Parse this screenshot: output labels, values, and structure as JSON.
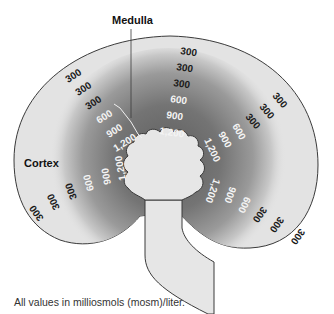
{
  "labels": {
    "medulla": "Medulla",
    "cortex": "Cortex"
  },
  "caption": "All values in milliosmols (mosm)/liter.",
  "colors": {
    "cortex_fill": "#e3e3e3",
    "medulla_dark": "#6b6b6b",
    "outline": "#3a3a3a",
    "pelvis_fill": "#e6e6e6",
    "cortex_text": "#1a1a1a",
    "medulla_text": "#f4f4f4"
  },
  "columns": [
    {
      "name": "upper-left",
      "values": [
        "300",
        "300",
        "300",
        "600",
        "900",
        "1,200"
      ]
    },
    {
      "name": "top",
      "values": [
        "300",
        "300",
        "300",
        "600",
        "900",
        "1,200"
      ]
    },
    {
      "name": "upper-right",
      "values": [
        "300",
        "300",
        "300",
        "600",
        "900",
        "1,200"
      ]
    },
    {
      "name": "lower-right",
      "values": [
        "300",
        "300",
        "300",
        "600",
        "900",
        "1,200"
      ]
    },
    {
      "name": "lower-left",
      "values": [
        "300",
        "300",
        "300",
        "600",
        "900",
        "1,200"
      ]
    }
  ]
}
